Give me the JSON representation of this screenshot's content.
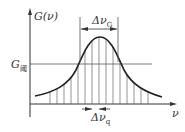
{
  "diagram": {
    "y_axis_label": "G(ν)",
    "x_axis_label": "ν",
    "threshold_label": {
      "main": "G",
      "sub": "阈"
    },
    "gain_bandwidth_label": {
      "main": "Δν",
      "sub": "G"
    },
    "mode_spacing_label": {
      "main": "Δν",
      "sub": "q"
    },
    "colors": {
      "line": "#333333",
      "background": "#ffffff"
    },
    "mode_lines_x": [
      50,
      57,
      64,
      71,
      78,
      85,
      92,
      99,
      106,
      113,
      120,
      127,
      134,
      141,
      148
    ]
  }
}
